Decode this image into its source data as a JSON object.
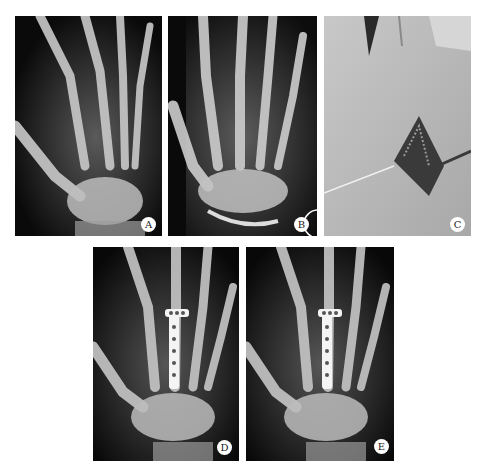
{
  "figure": {
    "panels": [
      {
        "id": "A",
        "label": "A",
        "kind": "radiograph",
        "view": "oblique pre-operative hand X-ray"
      },
      {
        "id": "B",
        "label": "B",
        "kind": "radiograph",
        "view": "AP pre-operative hand X-ray"
      },
      {
        "id": "C",
        "label": "C",
        "kind": "photograph",
        "view": "intra-operative dorsal hand incision with retractors"
      },
      {
        "id": "D",
        "label": "D",
        "kind": "radiograph",
        "view": "post-operative hand X-ray with plate fixation"
      },
      {
        "id": "E",
        "label": "E",
        "kind": "radiograph",
        "view": "follow-up hand X-ray with plate fixation"
      }
    ]
  },
  "colors": {
    "background": "#ffffff",
    "xray_dark": "#050505",
    "bone": "#cfcfcf",
    "plate": "#f4f4f4",
    "skin": "#b8b8b8",
    "label_bg": "#ffffff",
    "label_text": "#222222"
  }
}
